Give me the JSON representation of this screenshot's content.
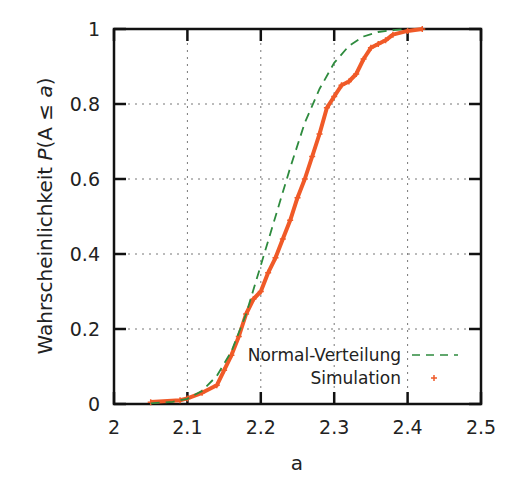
{
  "chart_data": {
    "type": "line",
    "title": "",
    "xlabel": "a",
    "ylabel": "Wahrscheinlichkeit P(A ≤ a)",
    "ylabel_parts": {
      "prefix": "Wahrscheinlichkeit ",
      "P": "P",
      "open": "(A ",
      "leq": "≤",
      "a": " a",
      "close": ")"
    },
    "xlim": [
      2.0,
      2.5
    ],
    "ylim": [
      0,
      1
    ],
    "xticks": [
      2.0,
      2.1,
      2.2,
      2.3,
      2.4,
      2.5
    ],
    "xtick_labels": [
      "2",
      "2.1",
      "2.2",
      "2.3",
      "2.4",
      "2.5"
    ],
    "yticks": [
      0,
      0.2,
      0.4,
      0.6,
      0.8,
      1
    ],
    "ytick_labels": [
      "0",
      "0.2",
      "0.4",
      "0.6",
      "0.8",
      "1"
    ],
    "grid": true,
    "legend_position": "lower right",
    "series": [
      {
        "name": "Normal-Verteilung",
        "style": "dashed",
        "color": "#2e8b3e",
        "x": [
          2.05,
          2.08,
          2.1,
          2.12,
          2.14,
          2.16,
          2.18,
          2.2,
          2.22,
          2.24,
          2.26,
          2.28,
          2.3,
          2.32,
          2.34,
          2.36,
          2.38,
          2.4
        ],
        "y": [
          0.002,
          0.006,
          0.014,
          0.035,
          0.075,
          0.14,
          0.24,
          0.37,
          0.5,
          0.63,
          0.75,
          0.84,
          0.91,
          0.955,
          0.98,
          0.992,
          0.997,
          1.0
        ]
      },
      {
        "name": "Simulation",
        "style": "markers",
        "marker": "+",
        "color": "#f05a28",
        "x": [
          2.05,
          2.09,
          2.1,
          2.12,
          2.14,
          2.15,
          2.16,
          2.17,
          2.18,
          2.19,
          2.2,
          2.21,
          2.22,
          2.23,
          2.24,
          2.25,
          2.26,
          2.27,
          2.28,
          2.29,
          2.3,
          2.31,
          2.32,
          2.33,
          2.34,
          2.35,
          2.36,
          2.37,
          2.38,
          2.4,
          2.42
        ],
        "y": [
          0.005,
          0.01,
          0.015,
          0.03,
          0.05,
          0.09,
          0.13,
          0.18,
          0.24,
          0.28,
          0.3,
          0.35,
          0.39,
          0.44,
          0.49,
          0.55,
          0.6,
          0.66,
          0.72,
          0.79,
          0.82,
          0.85,
          0.86,
          0.88,
          0.92,
          0.95,
          0.96,
          0.97,
          0.985,
          0.995,
          1.0
        ]
      }
    ]
  }
}
